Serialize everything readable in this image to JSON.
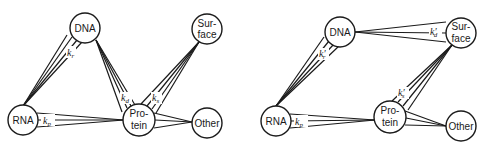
{
  "diagrams": [
    {
      "id": "left",
      "nodes": [
        {
          "key": "dna",
          "label_lines": [
            "DNA"
          ]
        },
        {
          "key": "surface",
          "label_lines": [
            "Sur-",
            "face"
          ]
        },
        {
          "key": "rna",
          "label_lines": [
            "RNA"
          ]
        },
        {
          "key": "protein",
          "label_lines": [
            "Pro-",
            "tein"
          ]
        },
        {
          "key": "other",
          "label_lines": [
            "Other"
          ]
        }
      ],
      "edges": [
        {
          "from": "dna",
          "to": "rna",
          "rate": {
            "symbol": "k",
            "sub": "r",
            "prime": false
          }
        },
        {
          "from": "rna",
          "to": "protein",
          "rate": {
            "symbol": "k",
            "sub": "p",
            "prime": false
          }
        },
        {
          "from": "dna",
          "to": "protein",
          "rate": {
            "symbol": "k",
            "sub": "d",
            "prime": false
          }
        },
        {
          "from": "surface",
          "to": "protein",
          "rate": {
            "symbol": "k",
            "sub": "s",
            "prime": false
          }
        },
        {
          "from": "protein",
          "to": "other",
          "rate": null
        }
      ]
    },
    {
      "id": "right",
      "nodes": [
        {
          "key": "dna",
          "label_lines": [
            "DNA"
          ]
        },
        {
          "key": "surface",
          "label_lines": [
            "Sur-",
            "face"
          ]
        },
        {
          "key": "rna",
          "label_lines": [
            "RNA"
          ]
        },
        {
          "key": "protein",
          "label_lines": [
            "Pro-",
            "tein"
          ]
        },
        {
          "key": "other",
          "label_lines": [
            "Other"
          ]
        }
      ],
      "edges": [
        {
          "from": "dna",
          "to": "rna",
          "rate": {
            "symbol": "k",
            "sub": "r",
            "prime": true
          }
        },
        {
          "from": "rna",
          "to": "protein",
          "rate": {
            "symbol": "k",
            "sub": "p",
            "prime": false
          }
        },
        {
          "from": "dna",
          "to": "surface",
          "rate": {
            "symbol": "k",
            "sub": "d",
            "prime": true
          }
        },
        {
          "from": "surface",
          "to": "protein",
          "rate": {
            "symbol": "k",
            "sub": "s",
            "prime": true
          }
        },
        {
          "from": "protein",
          "to": "other",
          "rate": null
        }
      ]
    }
  ],
  "labels": {
    "left": {
      "dna": "DNA",
      "surface_1": "Sur-",
      "surface_2": "face",
      "rna": "RNA",
      "protein_1": "Pro-",
      "protein_2": "tein",
      "other": "Other",
      "kr": "k",
      "kr_sub": "r",
      "kp": "k",
      "kp_sub": "p",
      "kd": "k",
      "kd_sub": "d",
      "ks": "k",
      "ks_sub": "s"
    },
    "right": {
      "dna": "DNA",
      "surface_1": "Sur-",
      "surface_2": "face",
      "rna": "RNA",
      "protein_1": "Pro-",
      "protein_2": "tein",
      "other": "Other",
      "kr": "k′",
      "kr_sub": "r",
      "kp": "k",
      "kp_sub": "p",
      "kd": "k′",
      "kd_sub": "d",
      "ks": "k′",
      "ks_sub": "s"
    }
  }
}
